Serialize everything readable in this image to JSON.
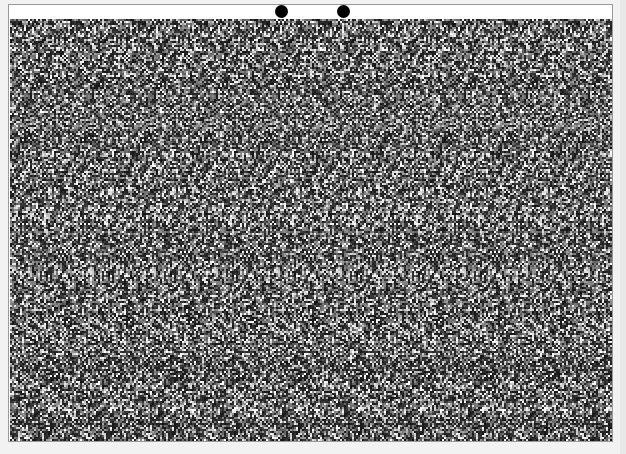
{
  "stereogram": {
    "type": "random-dot autostereogram",
    "fusion_dots": [
      {
        "name": "left-fusion-dot",
        "cx": 281,
        "cy": 10
      },
      {
        "name": "right-fusion-dot",
        "cx": 343,
        "cy": 10
      }
    ],
    "pattern_period_px": 62,
    "colors": {
      "dot": "#000000",
      "frame_border": "#9a9a9a",
      "background": "#ffffff",
      "page": "#f2f2f2"
    }
  }
}
